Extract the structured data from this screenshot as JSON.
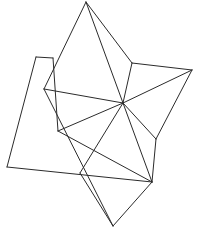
{
  "figure": {
    "background_color": "#ffffff",
    "stroke_color": "#2b2b2b",
    "stroke_width": 1,
    "width": 198,
    "height": 229
  },
  "chart_data": {
    "type": "scatter",
    "xlabel": "",
    "ylabel": "",
    "grid": false,
    "legend": false,
    "xlim": [
      0,
      198
    ],
    "ylim": [
      0,
      229
    ],
    "vertices": [
      {
        "id": "top-apex",
        "x": 86,
        "y": 2
      },
      {
        "id": "upper-right",
        "x": 132,
        "y": 63
      },
      {
        "id": "right-apex",
        "x": 192,
        "y": 70
      },
      {
        "id": "upper-left-corner",
        "x": 36,
        "y": 57
      },
      {
        "id": "upper-left-edge",
        "x": 53,
        "y": 58
      },
      {
        "id": "left-hub",
        "x": 44,
        "y": 89
      },
      {
        "id": "center-hub",
        "x": 123,
        "y": 103
      },
      {
        "id": "mid-left",
        "x": 58,
        "y": 131
      },
      {
        "id": "right-lower",
        "x": 156,
        "y": 139
      },
      {
        "id": "bottom-left-apex",
        "x": 7,
        "y": 167
      },
      {
        "id": "bottom-cross",
        "x": 80,
        "y": 173
      },
      {
        "id": "bottom-right",
        "x": 152,
        "y": 182
      },
      {
        "id": "bottom-apex",
        "x": 113,
        "y": 226
      }
    ],
    "edges": [
      {
        "from": "top-apex",
        "to": "center-hub"
      },
      {
        "from": "top-apex",
        "to": "upper-right"
      },
      {
        "from": "top-apex",
        "to": "left-hub"
      },
      {
        "from": "upper-right",
        "to": "center-hub"
      },
      {
        "from": "upper-right",
        "to": "right-apex"
      },
      {
        "from": "right-apex",
        "to": "center-hub"
      },
      {
        "from": "right-apex",
        "to": "right-lower"
      },
      {
        "from": "upper-left-corner",
        "to": "upper-left-edge"
      },
      {
        "from": "upper-left-corner",
        "to": "bottom-left-apex"
      },
      {
        "from": "upper-left-edge",
        "to": "mid-left"
      },
      {
        "from": "left-hub",
        "to": "center-hub"
      },
      {
        "from": "center-hub",
        "to": "mid-left"
      },
      {
        "from": "center-hub",
        "to": "right-lower"
      },
      {
        "from": "center-hub",
        "to": "bottom-right"
      },
      {
        "from": "center-hub",
        "to": "bottom-cross"
      },
      {
        "from": "mid-left",
        "to": "bottom-right"
      },
      {
        "from": "right-lower",
        "to": "bottom-right"
      },
      {
        "from": "bottom-left-apex",
        "to": "bottom-right"
      },
      {
        "from": "left-hub",
        "to": "bottom-apex"
      },
      {
        "from": "bottom-cross",
        "to": "bottom-apex"
      },
      {
        "from": "bottom-right",
        "to": "bottom-apex"
      }
    ]
  }
}
